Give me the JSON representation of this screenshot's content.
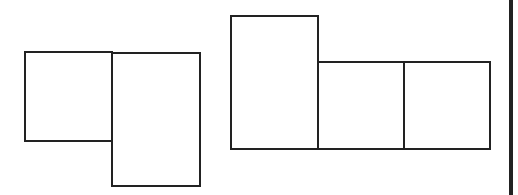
{
  "diagram": {
    "stroke_color": "#222222",
    "background": "#ffffff",
    "stroke_width": 2,
    "figures": [
      {
        "name": "left-net",
        "shapes": [
          {
            "name": "square-a",
            "x": 25,
            "y": 52,
            "w": 87,
            "h": 89
          },
          {
            "name": "rect-b",
            "x": 112,
            "y": 53,
            "w": 88,
            "h": 133
          }
        ]
      },
      {
        "name": "right-net",
        "shapes": [
          {
            "name": "rect-c",
            "x": 231,
            "y": 16,
            "w": 87,
            "h": 133
          },
          {
            "name": "square-d",
            "x": 318,
            "y": 62,
            "w": 86,
            "h": 87
          },
          {
            "name": "square-e",
            "x": 404,
            "y": 62,
            "w": 86,
            "h": 87
          }
        ]
      }
    ],
    "divider": {
      "x": 511,
      "width": 4,
      "color": "#222222"
    }
  }
}
